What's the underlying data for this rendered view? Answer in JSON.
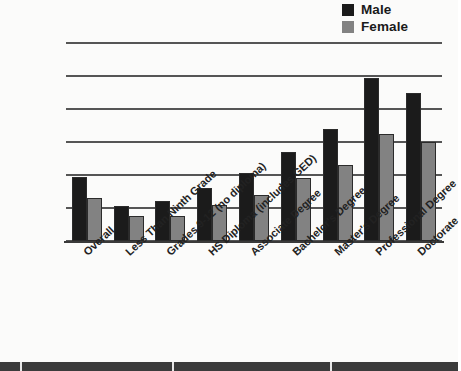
{
  "legend": {
    "position": "top-right",
    "items": [
      {
        "label": "Male",
        "color": "#1b1b1b",
        "icon": "legend-swatch-male"
      },
      {
        "label": "Female",
        "color": "#828282",
        "icon": "legend-swatch-female"
      }
    ]
  },
  "axis": {
    "y_ticks": [
      "$0",
      "$20,000",
      "$40,000",
      "$60,000",
      "$80,000",
      "$100,000",
      "$120,000"
    ],
    "y_min": 0,
    "y_max": 120000,
    "y_step": 20000
  },
  "chart_data": {
    "type": "bar",
    "title": "",
    "subtitle": "",
    "xlabel": "",
    "ylabel": "",
    "ylim": [
      0,
      120000
    ],
    "ytick_step": 20000,
    "grid": true,
    "legend_position": "top-right",
    "categories": [
      "Overall",
      "Less Than Ninth Grade",
      "Grades 9-12 (no diploma)",
      "HS Diploma (includes GED)",
      "Associate Degree",
      "Bachelor's Degree",
      "Master's Degree",
      "Professional Degree",
      "Doctorate"
    ],
    "series": [
      {
        "name": "Male",
        "color": "#1b1b1b",
        "values": [
          39000,
          21000,
          24000,
          32000,
          41000,
          54000,
          68000,
          99000,
          90000
        ]
      },
      {
        "name": "Female",
        "color": "#828282",
        "values": [
          26000,
          15000,
          15000,
          22000,
          28000,
          38000,
          46000,
          65000,
          60000
        ]
      }
    ]
  }
}
